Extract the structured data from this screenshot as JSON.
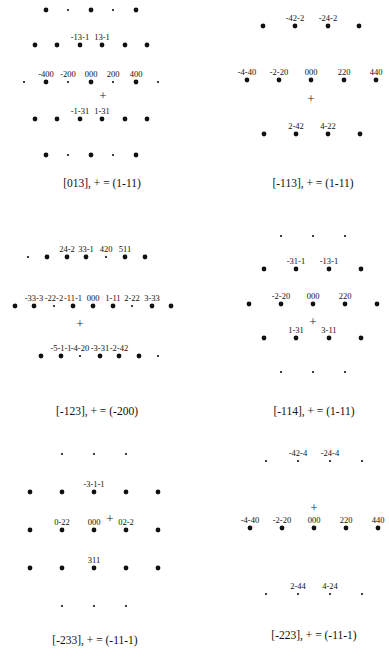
{
  "figure": {
    "panels": [
      {
        "id": "p013",
        "caption": "[013], + = (1-11)",
        "zone_axis": "[013]",
        "plus_reflection": "(1-11)",
        "labels": [
          "-13-1",
          "13-1",
          "-400",
          "-200",
          "000",
          "200",
          "400",
          "-1-31",
          "1-31"
        ]
      },
      {
        "id": "p-113",
        "caption": "[-113], + = (1-11)",
        "zone_axis": "[-113]",
        "plus_reflection": "(1-11)",
        "labels": [
          "-42-2",
          "-24-2",
          "-4-40",
          "-2-20",
          "000",
          "220",
          "440",
          "2-42",
          "4-22"
        ]
      },
      {
        "id": "p-123",
        "caption": "[-123], + = (-200)",
        "zone_axis": "[-123]",
        "plus_reflection": "(-200)",
        "labels": [
          "24-2",
          "33-1",
          "420",
          "511",
          "-33-3",
          "-22-2",
          "-11-1",
          "000",
          "1-11",
          "2-22",
          "3-33",
          "-5-1-1",
          "-4-20",
          "-3-31",
          "-2-42"
        ]
      },
      {
        "id": "p-114",
        "caption": "[-114], + = (1-11)",
        "zone_axis": "[-114]",
        "plus_reflection": "(1-11)",
        "labels": [
          "-31-1",
          "-13-1",
          "-2-20",
          "000",
          "220",
          "1-31",
          "3-11"
        ]
      },
      {
        "id": "p-233",
        "caption": "[-233], + = (-11-1)",
        "zone_axis": "[-233]",
        "plus_reflection": "(-11-1)",
        "labels": [
          "-3-1-1",
          "0-22",
          "000",
          "02-2",
          "311"
        ]
      },
      {
        "id": "p-223",
        "caption": "[-223], + = (-11-1)",
        "zone_axis": "[-223]",
        "plus_reflection": "(-11-1)",
        "labels": [
          "-42-4",
          "-24-4",
          "-4-40",
          "-2-20",
          "000",
          "220",
          "440",
          "2-44",
          "4-24"
        ]
      }
    ],
    "plus_symbol": "+",
    "colors": {
      "spot": "#111111",
      "background": "#ffffff"
    }
  }
}
